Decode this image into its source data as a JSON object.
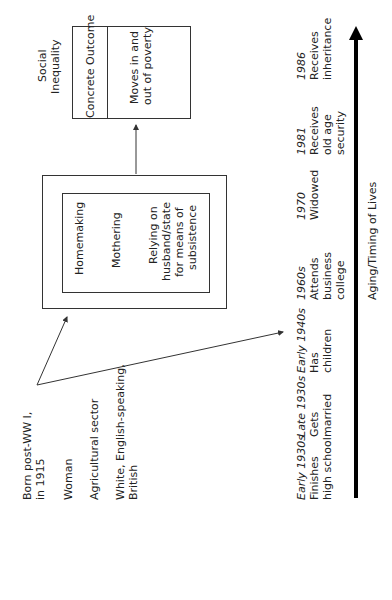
{
  "diagram": {
    "attributes": [
      "Born post-WW I, in 1915",
      "Woman",
      "Agricultural sector",
      "White, English-speaking, British"
    ],
    "attribute_lines": {
      "born_1": "Born post-WW I,",
      "born_2": "in 1915",
      "woman": "Woman",
      "agri": "Agricultural sector",
      "white_1": "White, English-speaking,",
      "white_2": "British"
    },
    "roles_box": {
      "items": [
        "Homemaking",
        "Mothering"
      ],
      "relying_1": "Relying on",
      "relying_2": "husband/state",
      "relying_3": "for means of",
      "relying_4": "subsistence"
    },
    "outcome": {
      "heading": "Social",
      "heading_2": "Inequality",
      "label": "Concrete Outcome",
      "value_1": "Moves in and",
      "value_2": "out of poverty"
    },
    "timeline": {
      "axis_label": "Aging/Timing of Lives",
      "events": [
        {
          "date": "Early 1930s",
          "l1": "Finishes",
          "l2": "high school",
          "l3": ""
        },
        {
          "date": "Late 1930s",
          "l1": "Gets",
          "l2": "married",
          "l3": ""
        },
        {
          "date": "Early 1940s",
          "l1": "Has",
          "l2": "children",
          "l3": ""
        },
        {
          "date": "1960s",
          "l1": "Attends",
          "l2": "business",
          "l3": "college"
        },
        {
          "date": "1970",
          "l1": "Widowed",
          "l2": "",
          "l3": ""
        },
        {
          "date": "1981",
          "l1": "Receives",
          "l2": "old age",
          "l3": "security"
        },
        {
          "date": "1986",
          "l1": "Receives",
          "l2": "inheritance",
          "l3": ""
        }
      ]
    },
    "colors": {
      "line": "#333333",
      "axis": "#000000",
      "text": "#222222"
    }
  }
}
